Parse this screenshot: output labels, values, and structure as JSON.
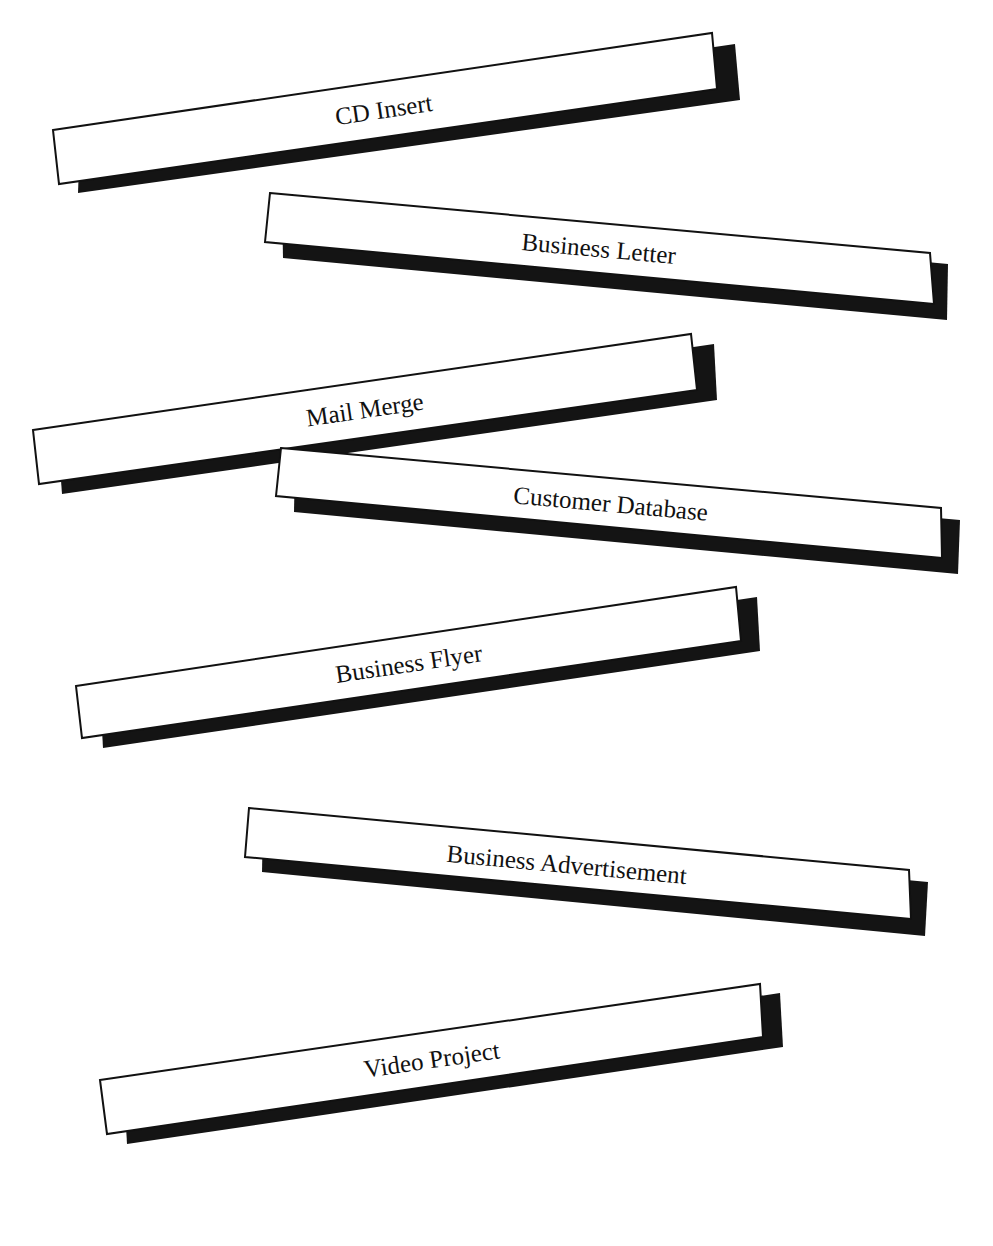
{
  "colors": {
    "background": "#ffffff",
    "box_fill": "#ffffff",
    "box_stroke": "#111111",
    "shadow": "#141414",
    "text": "#111111"
  },
  "banners": [
    {
      "label": "CD Insert",
      "box": "53,130 712,33 717,89 59,184",
      "shadow": "80,140 735,44 740,100 78,193",
      "text_x": 385,
      "text_y": 118,
      "angle": -8.4
    },
    {
      "label": "Business Letter",
      "box": "270,193 930,253 934,304 265,242",
      "shadow": "282,202 948,264 947,320 283,258",
      "text_x": 598,
      "text_y": 257,
      "angle": 5.2
    },
    {
      "label": "Mail Merge",
      "box": "33,430 691,334 697,390 39,484",
      "shadow": "58,440 714,344 717,400 62,494",
      "text_x": 366,
      "text_y": 418,
      "angle": -8.3
    },
    {
      "label": "Customer Database",
      "box": "281,448 941,508 942,558 276,496",
      "shadow": "295,460 960,520 958,574 294,512",
      "text_x": 610,
      "text_y": 512,
      "angle": 5.2
    },
    {
      "label": "Business Flyer",
      "box": "76,686 736,587 741,641 82,738",
      "shadow": "100,695 757,597 760,651 103,748",
      "text_x": 410,
      "text_y": 672,
      "angle": -8.5
    },
    {
      "label": "Business Advertisement",
      "box": "249,808 909,870 911,919 245,857",
      "shadow": "263,820 928,882 925,936 262,872",
      "text_x": 566,
      "text_y": 873,
      "angle": 5.3
    },
    {
      "label": "Video Project",
      "box": "100,1080 760,984 763,1037 107,1134",
      "shadow": "124,1090 780,993 783,1047 127,1144",
      "text_x": 433,
      "text_y": 1068,
      "angle": -8.3
    }
  ]
}
